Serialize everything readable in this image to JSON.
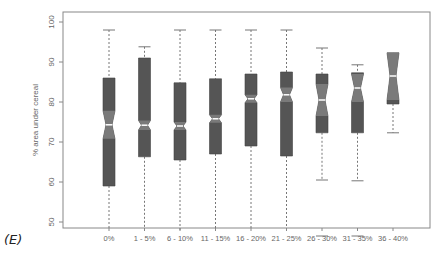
{
  "panel_label": "(E)",
  "chart_data": {
    "type": "boxplot",
    "title": "",
    "xlabel": "",
    "ylabel": "% area under cereal",
    "ylim": [
      48,
      102
    ],
    "yticks": [
      50,
      60,
      70,
      80,
      90,
      100
    ],
    "grid": false,
    "notched": true,
    "colors": {
      "box": "#555555",
      "notch": "#7a7a7a",
      "median": "#ffffff",
      "whisker": "#777777",
      "axis": "#888888"
    },
    "categories": [
      "0%",
      "1 - 5%",
      "6 - 10%",
      "11 - 15%",
      "16 - 20%",
      "21 - 25%",
      "26 - 30%",
      "31 - 35%",
      "36 - 40%"
    ],
    "boxes": [
      {
        "label": "0%",
        "whisker_low": 48,
        "q1": 59,
        "median": 74.3,
        "q3": 86,
        "whisker_high": 98,
        "notch": 3.5
      },
      {
        "label": "1 - 5%",
        "whisker_low": 48,
        "q1": 66.3,
        "median": 74.2,
        "q3": 91,
        "whisker_high": 93.8,
        "notch": 1.2
      },
      {
        "label": "6 - 10%",
        "whisker_low": 48,
        "q1": 65.5,
        "median": 74,
        "q3": 84.8,
        "whisker_high": 98,
        "notch": 1.0
      },
      {
        "label": "11 - 15%",
        "whisker_low": 48,
        "q1": 67,
        "median": 75.8,
        "q3": 85.8,
        "whisker_high": 98,
        "notch": 1.0
      },
      {
        "label": "16 - 20%",
        "whisker_low": 48,
        "q1": 69,
        "median": 80.8,
        "q3": 87,
        "whisker_high": 98,
        "notch": 1.0
      },
      {
        "label": "21 - 25%",
        "whisker_low": 48,
        "q1": 66.5,
        "median": 81.8,
        "q3": 87.5,
        "whisker_high": 98,
        "notch": 1.8
      },
      {
        "label": "26 - 30%",
        "whisker_low": 60.5,
        "q1": 72.3,
        "median": 80.5,
        "q3": 87,
        "whisker_high": 93.5,
        "notch": 4.0,
        "outliers": [
          48
        ]
      },
      {
        "label": "31 - 35%",
        "whisker_low": 60.3,
        "q1": 72.3,
        "median": 83.5,
        "q3": 87.3,
        "whisker_high": 89.3,
        "notch": 3.5,
        "outliers": [
          48
        ]
      },
      {
        "label": "36 - 40%",
        "whisker_low": 72.3,
        "q1": 79.5,
        "median": 86.5,
        "q3": 92.3,
        "whisker_high": 92.3,
        "notch": 6.0
      }
    ]
  }
}
